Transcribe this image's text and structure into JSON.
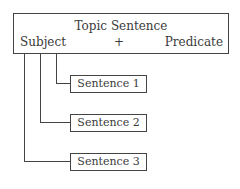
{
  "diagram": {
    "topic": {
      "title": "Topic Sentence",
      "subject": "Subject",
      "plus": "+",
      "predicate": "Predicate"
    },
    "sentences": [
      {
        "label": "Sentence 1"
      },
      {
        "label": "Sentence 2"
      },
      {
        "label": "Sentence 3"
      }
    ],
    "colors": {
      "line": "#444444",
      "text": "#3a3a3a",
      "background": "#ffffff"
    }
  }
}
